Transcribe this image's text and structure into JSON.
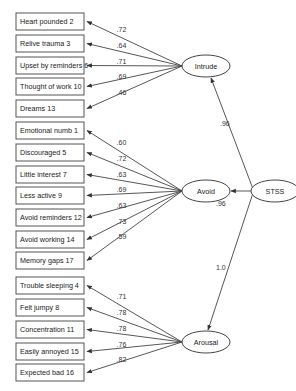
{
  "latent_factors": [
    {
      "id": "intrude",
      "label": "Intrude",
      "cx": 206,
      "cy": 66
    },
    {
      "id": "avoid",
      "label": "Avoid",
      "cx": 206,
      "cy": 191
    },
    {
      "id": "arousal",
      "label": "Arousal",
      "cx": 206,
      "cy": 342
    },
    {
      "id": "stss",
      "label": "STSS",
      "cx": 275,
      "cy": 191
    }
  ],
  "higher_order_paths": [
    {
      "from": "stss",
      "to": "intrude",
      "coefficient": ".96"
    },
    {
      "from": "stss",
      "to": "avoid",
      "coefficient": ".96"
    },
    {
      "from": "stss",
      "to": "arousal",
      "coefficient": "1.0"
    }
  ],
  "indicators": [
    {
      "label": "Heart pounded 2",
      "factor": "intrude",
      "y": 13,
      "loading": ".72"
    },
    {
      "label": "Relive trauma 3",
      "factor": "intrude",
      "y": 35,
      "loading": ".64"
    },
    {
      "label": "Upset by reminders 6",
      "factor": "intrude",
      "y": 57,
      "loading": ".71"
    },
    {
      "label": "Thought of work 10",
      "factor": "intrude",
      "y": 78,
      "loading": ".69"
    },
    {
      "label": "Dreams 13",
      "factor": "intrude",
      "y": 100,
      "loading": ".46"
    },
    {
      "label": "Emotional numb 1",
      "factor": "avoid",
      "y": 122,
      "loading": ".60"
    },
    {
      "label": "Discouraged 5",
      "factor": "avoid",
      "y": 144,
      "loading": ".72"
    },
    {
      "label": "Little interest 7",
      "factor": "avoid",
      "y": 166,
      "loading": ".63"
    },
    {
      "label": "Less active 9",
      "factor": "avoid",
      "y": 187,
      "loading": ".69"
    },
    {
      "label": "Avoid reminders 12",
      "factor": "avoid",
      "y": 209,
      "loading": ".63"
    },
    {
      "label": "Avoid working 14",
      "factor": "avoid",
      "y": 231,
      "loading": ".73"
    },
    {
      "label": "Memory gaps 17",
      "factor": "avoid",
      "y": 252,
      "loading": ".59"
    },
    {
      "label": "Trouble sleeping 4",
      "factor": "arousal",
      "y": 277,
      "loading": ".71"
    },
    {
      "label": "Felt jumpy 8",
      "factor": "arousal",
      "y": 299,
      "loading": ".78"
    },
    {
      "label": "Concentration 11",
      "factor": "arousal",
      "y": 321,
      "loading": ".78"
    },
    {
      "label": "Easily annoyed 15",
      "factor": "arousal",
      "y": 343,
      "loading": ".76"
    },
    {
      "label": "Expected bad 16",
      "factor": "arousal",
      "y": 364,
      "loading": ".82"
    }
  ],
  "colors": {
    "stroke": "#444444",
    "text": "#222222",
    "background": "#ffffff"
  }
}
